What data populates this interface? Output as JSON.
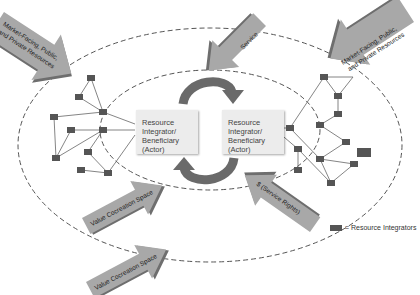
{
  "diagram": {
    "outer_ellipse": {
      "label": "Service ecosystem"
    },
    "actors": [
      {
        "label": "Resource Integrator/ Beneficiary (Actor)",
        "position": "left"
      },
      {
        "label": "Resource Integrator/ Beneficiary (Actor)",
        "position": "right"
      }
    ],
    "arrows": [
      {
        "label": "Market-Facing, Public, and Private Resources",
        "line1": "Market-Facing, Public,",
        "line2": "and Private Resources",
        "position": "top-left"
      },
      {
        "label": "Market-Facing, Public, and Private Resources",
        "line1": "Market-Facing, Public,",
        "line2": "and Private Resources",
        "position": "top-right"
      },
      {
        "label": "Service",
        "position": "top-center"
      },
      {
        "label": "Value Cocreation Space",
        "position": "mid-left"
      },
      {
        "label": "Value Cocreation Space",
        "position": "bottom-left"
      },
      {
        "label": "$ (Service Rights)",
        "position": "bottom-right"
      }
    ],
    "legend": {
      "label": "= Resource Integrators"
    },
    "colors": {
      "arrow_fill": "#a8a8a8",
      "arrow_shadow": "#6e6e6e",
      "node": "#555555",
      "cycle_arrow": "#6a6a6a",
      "actor_box": "#ececec",
      "dashed": "#555555"
    }
  }
}
